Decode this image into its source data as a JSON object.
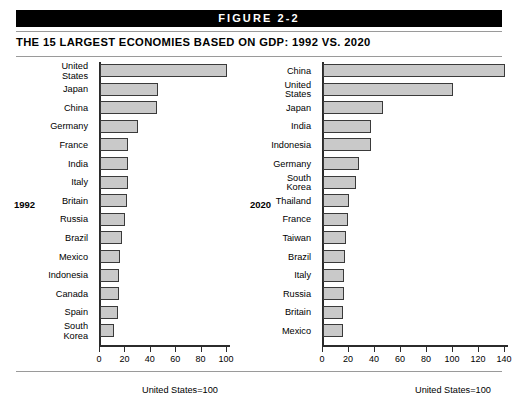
{
  "figure": {
    "banner_label": "FIGURE 2-2",
    "title": "THE 15 LARGEST ECONOMIES BASED ON GDP: 1992 VS. 2020"
  },
  "chart_data": [
    {
      "type": "bar",
      "orientation": "horizontal",
      "panel_label": "1992",
      "title": "THE 15 LARGEST ECONOMIES BASED ON GDP: 1992 VS. 2020",
      "xlabel": "",
      "ylabel": "",
      "annotation": "United States=100",
      "xlim": [
        0,
        100
      ],
      "xticks": [
        0,
        20,
        40,
        60,
        80,
        100
      ],
      "xticklabels": [
        "0",
        "20",
        "40",
        "60",
        "80",
        "100"
      ],
      "grid": false,
      "legend": "none",
      "categories": [
        "United\nStates",
        "Japan",
        "China",
        "Germany",
        "France",
        "India",
        "Italy",
        "Britain",
        "Russia",
        "Brazil",
        "Mexico",
        "Indonesia",
        "Canada",
        "Spain",
        "South\nKorea"
      ],
      "values": [
        100,
        46,
        45,
        30,
        22,
        22,
        22,
        21,
        20,
        17,
        16,
        15,
        15,
        14,
        11
      ]
    },
    {
      "type": "bar",
      "orientation": "horizontal",
      "panel_label": "2020",
      "title": "THE 15 LARGESTized ECONOMIES BASED ON GDP: 1992 VS. 2020",
      "xlabel": "",
      "ylabel": "",
      "annotation": "United States=100",
      "xlim": [
        0,
        140
      ],
      "xticks": [
        0,
        20,
        40,
        60,
        80,
        100,
        120,
        140
      ],
      "xticklabels": [
        "0",
        "20",
        "40",
        "60",
        "80",
        "100",
        "120",
        "140"
      ],
      "grid": false,
      "legend": "none",
      "categories": [
        "China",
        "United\nStates",
        "Japan",
        "India",
        "Indonesia",
        "Germany",
        "South\nKorea",
        "Thailand",
        "France",
        "Taiwan",
        "Brazil",
        "Italy",
        "Russia",
        "Britain",
        "Mexico"
      ],
      "values": [
        140,
        100,
        46,
        37,
        37,
        28,
        25,
        20,
        19,
        18,
        17,
        16,
        16,
        15,
        15
      ]
    }
  ]
}
